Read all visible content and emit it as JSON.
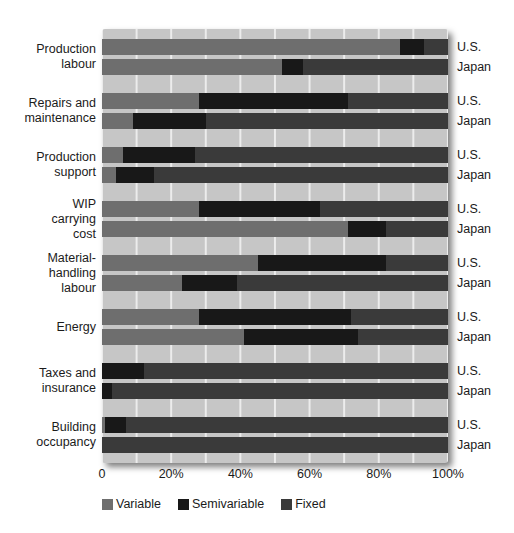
{
  "colors": {
    "variable": "#6e6e6e",
    "semivariable": "#181818",
    "fixed": "#3a3a3a",
    "panel_background": "#c6c6c6",
    "gridline": "#ececec",
    "text": "#1b1b1b"
  },
  "legend": {
    "items": [
      {
        "label": "Variable",
        "color": "#6e6e6e"
      },
      {
        "label": "Semivariable",
        "color": "#181818"
      },
      {
        "label": "Fixed",
        "color": "#3a3a3a"
      }
    ]
  },
  "chart_data": {
    "type": "bar",
    "orientation": "horizontal",
    "stacked": true,
    "unit": "percent",
    "xlim": [
      0,
      100
    ],
    "grid_interval_percent": 10,
    "x_ticks": [
      {
        "label": "0",
        "position": 0
      },
      {
        "label": "20%",
        "position": 20
      },
      {
        "label": "40%",
        "position": 40
      },
      {
        "label": "60%",
        "position": 60
      },
      {
        "label": "80%",
        "position": 80
      },
      {
        "label": "100%",
        "position": 100
      }
    ],
    "series_names": [
      "Variable",
      "Semivariable",
      "Fixed"
    ],
    "groups": [
      {
        "category": "Production labour",
        "label_lines": [
          "Production",
          "labour"
        ],
        "bars": [
          {
            "name": "U.S.",
            "values": [
              86,
              7,
              7
            ]
          },
          {
            "name": "Japan",
            "values": [
              52,
              6,
              42
            ]
          }
        ]
      },
      {
        "category": "Repairs and maintenance",
        "label_lines": [
          "Repairs and",
          "maintenance"
        ],
        "bars": [
          {
            "name": "U.S.",
            "values": [
              28,
              43,
              29
            ]
          },
          {
            "name": "Japan",
            "values": [
              9,
              21,
              70
            ]
          }
        ]
      },
      {
        "category": "Production support",
        "label_lines": [
          "Production",
          "support"
        ],
        "bars": [
          {
            "name": "U.S.",
            "values": [
              6,
              21,
              73
            ]
          },
          {
            "name": "Japan",
            "values": [
              4,
              11,
              85
            ]
          }
        ]
      },
      {
        "category": "WIP carrying cost",
        "label_lines": [
          "WIP",
          "carrying",
          "cost"
        ],
        "bars": [
          {
            "name": "U.S.",
            "values": [
              28,
              35,
              37
            ]
          },
          {
            "name": "Japan",
            "values": [
              71,
              11,
              18
            ]
          }
        ]
      },
      {
        "category": "Material-handling labour",
        "label_lines": [
          "Material-",
          "handling",
          "labour"
        ],
        "bars": [
          {
            "name": "U.S.",
            "values": [
              45,
              37,
              18
            ]
          },
          {
            "name": "Japan",
            "values": [
              23,
              16,
              61
            ]
          }
        ]
      },
      {
        "category": "Energy",
        "label_lines": [
          "Energy"
        ],
        "bars": [
          {
            "name": "U.S.",
            "values": [
              28,
              44,
              28
            ]
          },
          {
            "name": "Japan",
            "values": [
              41,
              33,
              26
            ]
          }
        ]
      },
      {
        "category": "Taxes and insurance",
        "label_lines": [
          "Taxes and",
          "insurance"
        ],
        "bars": [
          {
            "name": "U.S.",
            "values": [
              0,
              12,
              88
            ]
          },
          {
            "name": "Japan",
            "values": [
              0,
              3,
              97
            ]
          }
        ]
      },
      {
        "category": "Building occupancy",
        "label_lines": [
          "Building",
          "occupancy"
        ],
        "bars": [
          {
            "name": "U.S.",
            "values": [
              1,
              6,
              93
            ]
          },
          {
            "name": "Japan",
            "values": [
              0,
              0,
              100
            ]
          }
        ]
      }
    ]
  }
}
